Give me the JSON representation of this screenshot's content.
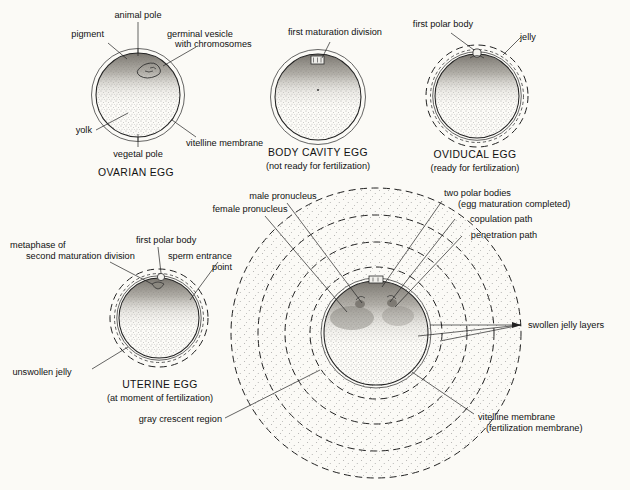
{
  "figure": {
    "background_color": "#fbfaf6",
    "ink_color": "#111111"
  },
  "panels": [
    {
      "id": "ovarian-egg",
      "caption": "OVARIAN EGG",
      "subcaption": "",
      "labels": [
        {
          "name": "animal-pole",
          "text": "animal pole"
        },
        {
          "name": "pigment",
          "text": "pigment"
        },
        {
          "name": "germinal-vesicle",
          "text": "germinal vesicle"
        },
        {
          "name": "germinal-vesicle-line2",
          "text": "with chromosomes"
        },
        {
          "name": "yolk",
          "text": "yolk"
        },
        {
          "name": "vegetal-pole",
          "text": "vegetal pole"
        },
        {
          "name": "vitelline-membrane",
          "text": "vitelline membrane"
        }
      ]
    },
    {
      "id": "body-cavity-egg",
      "caption": "BODY CAVITY EGG",
      "subcaption": "(not ready for fertilization)",
      "labels": [
        {
          "name": "first-maturation-division",
          "text": "first maturation division"
        }
      ]
    },
    {
      "id": "oviducal-egg",
      "caption": "OVIDUCAL EGG",
      "subcaption": "(ready for fertilization)",
      "labels": [
        {
          "name": "first-polar-body",
          "text": "first polar body"
        },
        {
          "name": "jelly",
          "text": "jelly"
        }
      ]
    },
    {
      "id": "uterine-egg",
      "caption": "UTERINE EGG",
      "subcaption": "(at moment of fertilization)",
      "labels": [
        {
          "name": "metaphase-line1",
          "text": "metaphase of"
        },
        {
          "name": "metaphase-line2",
          "text": "second maturation division"
        },
        {
          "name": "first-polar-body",
          "text": "first polar body"
        },
        {
          "name": "sperm-entrance-line1",
          "text": "sperm entrance"
        },
        {
          "name": "sperm-entrance-line2",
          "text": "point"
        },
        {
          "name": "unswollen-jelly",
          "text": "unswollen jelly"
        }
      ]
    },
    {
      "id": "fertilized-egg",
      "caption": "",
      "subcaption": "",
      "labels": [
        {
          "name": "male-pronucleus",
          "text": "male pronucleus"
        },
        {
          "name": "female-pronucleus",
          "text": "female pronucleus"
        },
        {
          "name": "two-polar-bodies-line1",
          "text": "two polar bodies"
        },
        {
          "name": "two-polar-bodies-line2",
          "text": "(egg maturation completed)"
        },
        {
          "name": "copulation-path",
          "text": "copulation path"
        },
        {
          "name": "penetration-path",
          "text": "penetration path"
        },
        {
          "name": "swollen-jelly-layers",
          "text": "swollen jelly layers"
        },
        {
          "name": "vitelline-membrane-line1",
          "text": "vitelline membrane"
        },
        {
          "name": "vitelline-membrane-line2",
          "text": "(fertilization membrane)"
        },
        {
          "name": "gray-crescent-region",
          "text": "gray crescent region"
        }
      ]
    }
  ]
}
